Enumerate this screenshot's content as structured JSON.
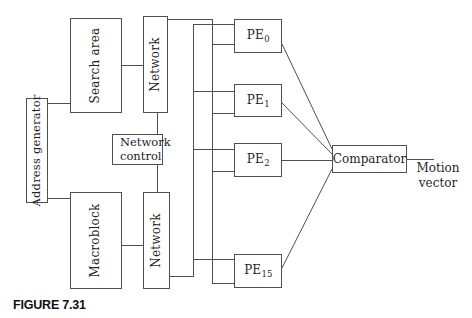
{
  "figure": {
    "caption": "FIGURE 7.31"
  },
  "blocks": {
    "address_generator": {
      "label": "Address generator"
    },
    "search_area": {
      "label": "Search area"
    },
    "macroblock": {
      "label": "Macroblock"
    },
    "network_top": {
      "label": "Network"
    },
    "network_bottom": {
      "label": "Network"
    },
    "network_control": {
      "line1": "Network",
      "line2": "control"
    },
    "comparator": {
      "label": "Comparator"
    },
    "pe_units": [
      {
        "base": "PE",
        "subscript": "0"
      },
      {
        "base": "PE",
        "subscript": "1"
      },
      {
        "base": "PE",
        "subscript": "2"
      },
      {
        "base": "PE",
        "subscript": "15"
      }
    ]
  },
  "output": {
    "line1": "Motion",
    "line2": "vector"
  },
  "colors": {
    "line": "#4f4f4f",
    "text": "#1f1f1f",
    "background": "#ffffff"
  }
}
